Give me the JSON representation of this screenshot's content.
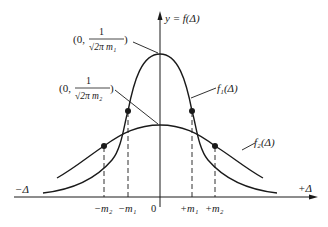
{
  "diagram": {
    "type": "normal-distribution-comparison",
    "y_axis_label": "y = f(Δ)",
    "x_axis_negative_label": "−Δ",
    "x_axis_positive_label": "+Δ",
    "origin_label": "0",
    "ticks": [
      {
        "label": "−m₂",
        "x": 104
      },
      {
        "label": "−m₁",
        "x": 128
      },
      {
        "label": "+m₁",
        "x": 192
      },
      {
        "label": "+m₂",
        "x": 215
      }
    ],
    "curves": [
      {
        "name": "f₁(Δ)",
        "label": "f₁(Δ)",
        "peak_label_prefix": "(0,",
        "peak_label_num": "1",
        "peak_label_den": "√2π m₁",
        "peak_label_suffix": ")"
      },
      {
        "name": "f₂(Δ)",
        "label": "f₂(Δ)",
        "peak_label_prefix": "(0,",
        "peak_label_num": "1",
        "peak_label_den": "√2π m₂",
        "peak_label_suffix": ")"
      }
    ],
    "colors": {
      "stroke": "#1a1a1a",
      "background": "#ffffff"
    }
  }
}
